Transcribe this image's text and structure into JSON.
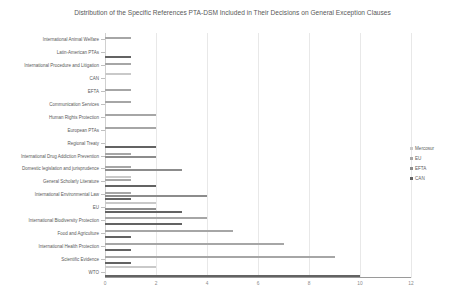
{
  "chart_data": {
    "type": "bar",
    "orientation": "horizontal",
    "title": "Distribution of the Specific References PTA-DSM Included in Their Decisions on General Exception Clauses",
    "xlabel": "",
    "ylabel": "",
    "xlim": [
      0,
      12
    ],
    "xticks": [
      0,
      2,
      4,
      6,
      8,
      10,
      12
    ],
    "grid": true,
    "legend_position": "right",
    "legend": [
      "Mercosur",
      "EU",
      "EFTA",
      "CAN"
    ],
    "colors": {
      "Mercosur": "#c9c9c9",
      "EU": "#a6a6a6",
      "EFTA": "#8c8c8c",
      "CAN": "#636363"
    },
    "categories": [
      "International Animal Welfare",
      "Latin-American PTAs",
      "International Procedure and Litigation",
      "CAN",
      "EFTA",
      "Communication Services",
      "Human Rights Protection",
      "European PTAs",
      "Regional Treaty",
      "International Drug Addiction Prevention",
      "Domestic legislation and jurisprudence",
      "General Scholarly Literature",
      "International Environmental Law",
      "EU",
      "International Biodiversity Protection",
      "Food and Agriculture",
      "International Health Protection",
      "Scientific Evidence",
      "WTO"
    ],
    "series": [
      {
        "name": "Mercosur",
        "values": [
          0,
          0,
          0,
          1,
          0,
          0,
          0,
          0,
          0,
          0,
          0,
          1,
          0,
          2,
          0,
          0,
          0,
          0,
          2
        ]
      },
      {
        "name": "EU",
        "values": [
          1,
          0,
          1,
          0,
          1,
          1,
          2,
          2,
          0,
          1,
          1,
          1,
          1,
          0,
          4,
          5,
          7,
          9,
          0
        ]
      },
      {
        "name": "EFTA",
        "values": [
          0,
          0,
          0,
          0,
          0,
          0,
          0,
          0,
          0,
          2,
          3,
          0,
          4,
          2,
          0,
          0,
          0,
          0,
          0
        ]
      },
      {
        "name": "CAN",
        "values": [
          0,
          1,
          0,
          0,
          0,
          0,
          0,
          0,
          2,
          0,
          0,
          2,
          1,
          3,
          3,
          1,
          1,
          1,
          10
        ]
      }
    ]
  }
}
